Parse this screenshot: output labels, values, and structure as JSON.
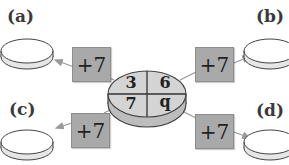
{
  "diagram": {
    "center_disc": {
      "values": [
        "3",
        "6",
        "7",
        "q"
      ]
    },
    "operators": [
      {
        "label": "+7",
        "target": "a"
      },
      {
        "label": "+7",
        "target": "b"
      },
      {
        "label": "+7",
        "target": "c"
      },
      {
        "label": "+7",
        "target": "d"
      }
    ],
    "outputs": [
      {
        "label": "(a)"
      },
      {
        "label": "(b)"
      },
      {
        "label": "(c)"
      },
      {
        "label": "(d)"
      }
    ]
  },
  "colors": {
    "disc_fill": "#d4d4d4",
    "operator_fill": "#a9a9a9",
    "line": "#9a9a9a",
    "output_fill": "#ffffff"
  }
}
